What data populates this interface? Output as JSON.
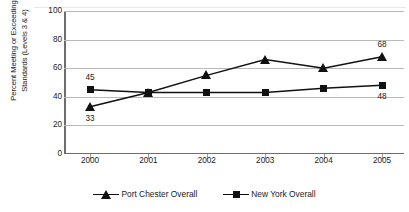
{
  "chart_data": {
    "type": "line",
    "title": "",
    "xlabel": "",
    "ylabel_line1": "Percent Meeting or Exceeding",
    "ylabel_line2": "Standards (Levels 3 & 4)",
    "categories": [
      "2000",
      "2001",
      "2002",
      "2003",
      "2004",
      "2005"
    ],
    "ylim": [
      0,
      100
    ],
    "yticks": [
      "0",
      "20",
      "40",
      "60",
      "80",
      "100"
    ],
    "grid": true,
    "legend_position": "bottom",
    "series": [
      {
        "name": "Port Chester Overall",
        "marker": "triangle",
        "color": "#111111",
        "values": [
          33,
          43,
          55,
          66,
          60,
          68
        ],
        "point_labels": [
          {
            "index": 0,
            "text": "33",
            "position": "below"
          },
          {
            "index": 5,
            "text": "68",
            "position": "above"
          }
        ]
      },
      {
        "name": "New York Overall",
        "marker": "square",
        "color": "#111111",
        "values": [
          45,
          43,
          43,
          43,
          46,
          48
        ],
        "point_labels": [
          {
            "index": 0,
            "text": "45",
            "position": "above"
          },
          {
            "index": 5,
            "text": "48",
            "position": "below"
          }
        ]
      }
    ]
  }
}
